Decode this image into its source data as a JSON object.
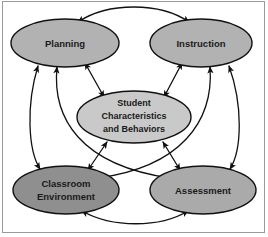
{
  "diagram": {
    "background_color": "#ffffff",
    "border_color": "#9a9a9a",
    "line_color": "#111111",
    "text_color": "#1a1a1a",
    "nodes": [
      {
        "id": "planning",
        "label": "Planning",
        "shape": "ellipse",
        "fill": "#b2b2b2",
        "cx": 65,
        "cy": 43,
        "rx": 54,
        "ry": 24,
        "lines": [
          "Planning"
        ]
      },
      {
        "id": "instruction",
        "label": "Instruction",
        "shape": "ellipse",
        "fill": "#b2b2b2",
        "cx": 201,
        "cy": 43,
        "rx": 51,
        "ry": 24,
        "lines": [
          "Instruction"
        ]
      },
      {
        "id": "student-characteristics",
        "label": "Student Characteristics and Behaviors",
        "shape": "ellipse",
        "fill": "#c9c9c9",
        "cx": 134,
        "cy": 117,
        "rx": 57,
        "ry": 26,
        "lines": [
          "Student",
          "Characteristics",
          "and Behaviors"
        ]
      },
      {
        "id": "classroom-environment",
        "label": "Classroom Environment",
        "shape": "ellipse",
        "fill": "#8f8f8f",
        "cx": 66,
        "cy": 190,
        "rx": 53,
        "ry": 24,
        "lines": [
          "Classroom",
          "Environment"
        ]
      },
      {
        "id": "assessment",
        "label": "Assessment",
        "shape": "ellipse",
        "fill": "#aaaaaa",
        "cx": 203,
        "cy": 190,
        "rx": 53,
        "ry": 24,
        "lines": [
          "Assessment"
        ]
      }
    ],
    "edges": [
      {
        "id": "planning-instruction",
        "from": "planning",
        "to": "instruction",
        "arrow": "double",
        "style": "curved-top"
      },
      {
        "id": "planning-student",
        "from": "planning",
        "to": "student-characteristics",
        "arrow": "double",
        "style": "straight"
      },
      {
        "id": "instruction-student",
        "from": "instruction",
        "to": "student-characteristics",
        "arrow": "double",
        "style": "straight"
      },
      {
        "id": "planning-classroom",
        "from": "planning",
        "to": "classroom-environment",
        "arrow": "double",
        "style": "curved-left"
      },
      {
        "id": "planning-assessment",
        "from": "planning",
        "to": "assessment",
        "arrow": "double",
        "style": "curved-long"
      },
      {
        "id": "instruction-assessment",
        "from": "instruction",
        "to": "assessment",
        "arrow": "double",
        "style": "curved-right"
      },
      {
        "id": "instruction-classroom",
        "from": "instruction",
        "to": "classroom-environment",
        "arrow": "double",
        "style": "curved-long"
      },
      {
        "id": "classroom-student",
        "from": "classroom-environment",
        "to": "student-characteristics",
        "arrow": "double",
        "style": "straight"
      },
      {
        "id": "assessment-student",
        "from": "assessment",
        "to": "student-characteristics",
        "arrow": "double",
        "style": "straight"
      },
      {
        "id": "classroom-assessment",
        "from": "classroom-environment",
        "to": "assessment",
        "arrow": "double",
        "style": "curved-bottom"
      }
    ]
  }
}
